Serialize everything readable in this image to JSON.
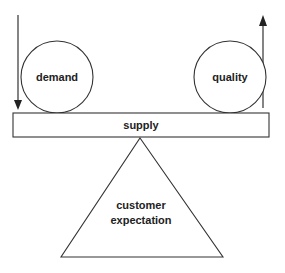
{
  "diagram": {
    "type": "balance-scale",
    "colors": {
      "stroke": "#333333",
      "text": "#222222",
      "background": "#ffffff"
    },
    "left_weight": {
      "label": "demand",
      "arrow_direction": "down"
    },
    "right_weight": {
      "label": "quality",
      "arrow_direction": "up"
    },
    "beam": {
      "label": "supply"
    },
    "fulcrum": {
      "label_line1": "customer",
      "label_line2": "expectation"
    }
  }
}
